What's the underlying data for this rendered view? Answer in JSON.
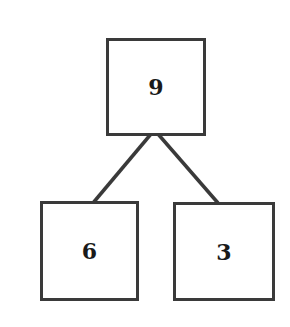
{
  "diagram": {
    "type": "number-bond",
    "colors": {
      "stroke": "#3a3a3a",
      "text": "#1a1a1a",
      "background": "#ffffff"
    },
    "nodes": [
      {
        "id": "whole",
        "value": "9"
      },
      {
        "id": "part-left",
        "value": "6"
      },
      {
        "id": "part-right",
        "value": "3"
      }
    ],
    "edges": [
      {
        "from": "whole",
        "to": "part-left"
      },
      {
        "from": "whole",
        "to": "part-right"
      }
    ]
  }
}
